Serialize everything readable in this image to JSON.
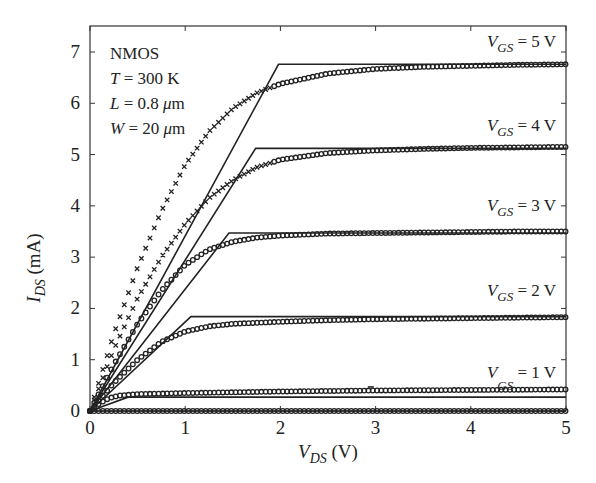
{
  "chart_data": {
    "type": "line",
    "title": "",
    "xlabel": "V_DS (V)",
    "ylabel": "I_DS (mA)",
    "xlim": [
      0,
      5
    ],
    "ylim": [
      0,
      7.4
    ],
    "x_ticks": [
      "0",
      "1",
      "2",
      "3",
      "4",
      "5"
    ],
    "y_ticks": [
      "0",
      "1",
      "2",
      "3",
      "4",
      "5",
      "6",
      "7"
    ],
    "grid": false,
    "legend": "none (inline curve labels)",
    "annotation_box": [
      "NMOS",
      "T = 300 K",
      "L = 0.8 μm",
      "W = 20 μm"
    ],
    "curve_labels": [
      {
        "vgs": "5 V",
        "text_main": "V",
        "text_sub": "GS",
        "text_tail": " = 5 V"
      },
      {
        "vgs": "4 V",
        "text_main": "V",
        "text_sub": "GS",
        "text_tail": " = 4 V"
      },
      {
        "vgs": "3 V",
        "text_main": "V",
        "text_sub": "GS",
        "text_tail": " = 3 V"
      },
      {
        "vgs": "2 V",
        "text_main": "V",
        "text_sub": "GS",
        "text_tail": " = 2 V"
      },
      {
        "vgs": "1 V",
        "text_main": "V",
        "text_sub": "GS",
        "text_tail": " = 1 V"
      }
    ],
    "series": [
      {
        "name": "Model (line) V_GS=5 V",
        "style": "solid",
        "x": [
          0,
          1.98,
          5
        ],
        "y": [
          0,
          6.76,
          6.76
        ]
      },
      {
        "name": "Model (line) V_GS=4 V",
        "style": "solid",
        "x": [
          0,
          1.74,
          5
        ],
        "y": [
          0,
          5.12,
          5.12
        ]
      },
      {
        "name": "Model (line) V_GS=3 V",
        "style": "solid",
        "x": [
          0,
          1.46,
          5
        ],
        "y": [
          0,
          3.47,
          3.47
        ]
      },
      {
        "name": "Model (line) V_GS=2 V",
        "style": "solid",
        "x": [
          0,
          1.06,
          5
        ],
        "y": [
          0,
          1.84,
          1.84
        ]
      },
      {
        "name": "Model (line) V_GS=1 V",
        "style": "solid",
        "x": [
          0,
          0.4,
          5
        ],
        "y": [
          0,
          0.27,
          0.27
        ]
      },
      {
        "name": "Model (line) V_GS=0 V",
        "style": "solid",
        "x": [
          0,
          5
        ],
        "y": [
          0,
          0
        ]
      },
      {
        "name": "Data V_GS=5 V",
        "style": "markers",
        "x": [
          0,
          0.25,
          0.5,
          0.75,
          1.0,
          1.25,
          1.5,
          1.75,
          2.0,
          2.5,
          3.0,
          3.5,
          4.0,
          4.5,
          5.0
        ],
        "y": [
          0,
          1.5,
          2.8,
          3.9,
          4.8,
          5.45,
          5.9,
          6.2,
          6.38,
          6.58,
          6.67,
          6.71,
          6.73,
          6.75,
          6.76
        ]
      },
      {
        "name": "Data V_GS=4 V",
        "style": "markers",
        "x": [
          0,
          0.25,
          0.5,
          0.75,
          1.0,
          1.25,
          1.5,
          1.75,
          2.0,
          2.5,
          3.0,
          3.5,
          4.0,
          4.5,
          5.0
        ],
        "y": [
          0,
          1.2,
          2.2,
          3.0,
          3.65,
          4.15,
          4.5,
          4.75,
          4.9,
          5.03,
          5.08,
          5.11,
          5.13,
          5.14,
          5.15
        ]
      },
      {
        "name": "Data V_GS=3 V",
        "style": "markers",
        "x": [
          0,
          0.25,
          0.5,
          0.75,
          1.0,
          1.25,
          1.5,
          1.75,
          2.0,
          2.5,
          3.0,
          3.5,
          4.0,
          4.5,
          5.0
        ],
        "y": [
          0,
          0.9,
          1.7,
          2.35,
          2.85,
          3.15,
          3.3,
          3.38,
          3.42,
          3.46,
          3.47,
          3.48,
          3.49,
          3.5,
          3.5
        ]
      },
      {
        "name": "Data V_GS=2 V",
        "style": "markers",
        "x": [
          0,
          0.25,
          0.5,
          0.75,
          1.0,
          1.25,
          1.5,
          2.0,
          2.5,
          3.0,
          3.5,
          4.0,
          4.5,
          5.0
        ],
        "y": [
          0,
          0.55,
          1.0,
          1.35,
          1.55,
          1.65,
          1.7,
          1.74,
          1.77,
          1.79,
          1.8,
          1.81,
          1.82,
          1.83
        ]
      },
      {
        "name": "Data V_GS=1 V",
        "style": "markers",
        "x": [
          0,
          0.1,
          0.2,
          0.3,
          0.5,
          1.0,
          2.0,
          3.0,
          4.0,
          5.0
        ],
        "y": [
          0,
          0.15,
          0.25,
          0.3,
          0.33,
          0.35,
          0.38,
          0.4,
          0.41,
          0.42
        ]
      },
      {
        "name": "Data V_GS=0 V",
        "style": "markers",
        "x": [
          0,
          1,
          2,
          3,
          4,
          5
        ],
        "y": [
          0,
          0,
          0,
          0,
          0,
          0
        ]
      }
    ]
  },
  "labels": {
    "ann_line1": "NMOS",
    "ann_T": "T",
    "ann_T_val": " = 300 K",
    "ann_L": "L",
    "ann_L_val": " = 0.8  ",
    "ann_W": "W",
    "ann_W_val": " = 20  ",
    "ann_mu": "μ",
    "ann_m": "m",
    "ylabel_main": "I",
    "ylabel_sub": "DS",
    "ylabel_tail": " (mA)",
    "xlabel_main": "V",
    "xlabel_sub": "DS",
    "xlabel_tail": " (V)"
  },
  "colors": {
    "ink": "#222222",
    "background": "#ffffff"
  }
}
